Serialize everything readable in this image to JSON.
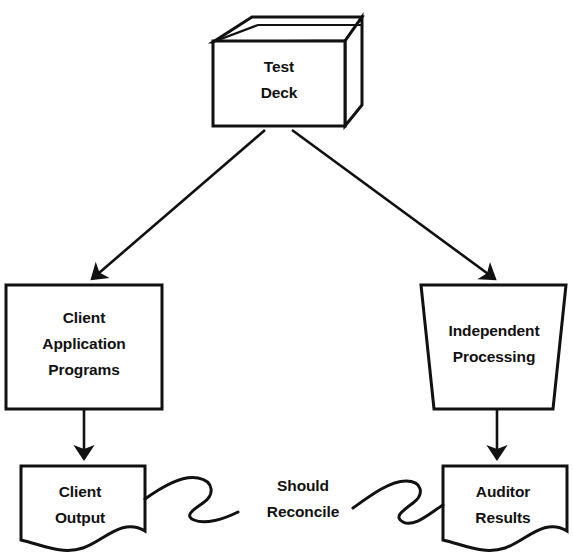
{
  "diagram": {
    "background_color": "#ffffff",
    "stroke_color": "#111111",
    "nodes": {
      "test_deck": {
        "id": "test-deck",
        "shape": "3d-box",
        "line1": "Test",
        "line2": "Deck"
      },
      "client_application_programs": {
        "id": "client-application-programs",
        "shape": "rectangle",
        "line1": "Client",
        "line2": "Application",
        "line3": "Programs"
      },
      "independent_processing": {
        "id": "independent-processing",
        "shape": "trapezoid",
        "line1": "Independent",
        "line2": "Processing"
      },
      "client_output": {
        "id": "client-output",
        "shape": "document",
        "line1": "Client",
        "line2": "Output"
      },
      "auditor_results": {
        "id": "auditor-results",
        "shape": "document",
        "line1": "Auditor",
        "line2": "Results"
      }
    },
    "edges": {
      "deck_to_client_apps": {
        "id": "test-deck-to-client-application-programs",
        "style": "arrow",
        "label": ""
      },
      "deck_to_independent": {
        "id": "test-deck-to-independent-processing",
        "style": "arrow",
        "label": ""
      },
      "client_apps_to_output": {
        "id": "client-application-programs-to-client-output",
        "style": "arrow",
        "label": ""
      },
      "independent_to_results": {
        "id": "independent-processing-to-auditor-results",
        "style": "arrow",
        "label": ""
      },
      "reconcile": {
        "id": "client-output-to-auditor-results",
        "style": "squiggle",
        "label_line1": "Should",
        "label_line2": "Reconcile"
      }
    }
  }
}
